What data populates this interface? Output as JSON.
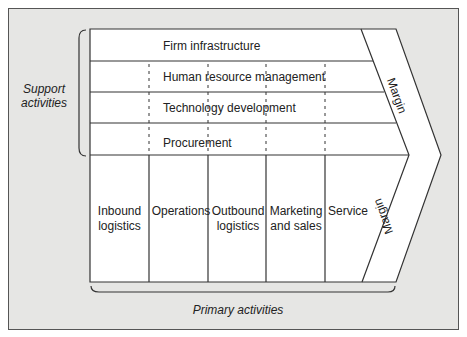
{
  "diagram": {
    "support_label": [
      "Support",
      "activities"
    ],
    "primary_label": "Primary activities",
    "margin_label": "Margin",
    "support_activities": [
      "Firm infrastructure",
      "Human resource management",
      "Technology development",
      "Procurement"
    ],
    "primary_activities": [
      [
        "Inbound",
        "logistics"
      ],
      [
        "Operations"
      ],
      [
        "Outbound",
        "logistics"
      ],
      [
        "Marketing",
        "and sales"
      ],
      [
        "Service"
      ]
    ],
    "colors": {
      "background": "#e6e6e4",
      "box": "#ffffff",
      "line": "#333333"
    }
  }
}
